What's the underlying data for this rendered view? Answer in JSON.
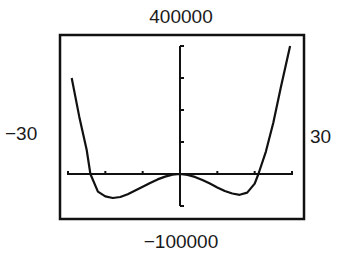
{
  "chart_data": {
    "type": "line",
    "title": "",
    "xlabel": "",
    "ylabel": "",
    "window": {
      "xmin": -30,
      "xmax": 30,
      "xscl": 10,
      "ymin": -100000,
      "ymax": 400000,
      "yscl": 100000
    },
    "window_labels": {
      "xmin": "−30",
      "xmax": "30",
      "ymin": "−100000",
      "ymax": "400000"
    },
    "grid": false,
    "legend": null,
    "series": [
      {
        "name": "f(x)",
        "description": "quartic curve with local max at origin and two local minima",
        "x": [
          -29,
          -27,
          -25,
          -24,
          -22,
          -20,
          -18,
          -16,
          -14,
          -12,
          -10,
          -8,
          -6,
          -4,
          -2,
          0,
          2,
          4,
          6,
          8,
          10,
          12,
          14,
          16,
          18,
          20,
          21,
          23,
          25,
          27,
          29.5
        ],
        "y": [
          300000,
          180000,
          75000,
          0,
          -55000,
          -70000,
          -75000,
          -72000,
          -63000,
          -52000,
          -40000,
          -28000,
          -17000,
          -8000,
          -2000,
          0,
          -3000,
          -9000,
          -19000,
          -30000,
          -42000,
          -53000,
          -61000,
          -65000,
          -58000,
          -30000,
          0,
          70000,
          160000,
          270000,
          400000
        ]
      }
    ],
    "annotations": {
      "x_intercepts_approx": [
        -24,
        0,
        21
      ],
      "local_minima_approx": [
        [
          -18,
          -75000
        ],
        [
          16,
          -65000
        ]
      ],
      "local_maximum_approx": [
        0,
        0
      ]
    }
  }
}
